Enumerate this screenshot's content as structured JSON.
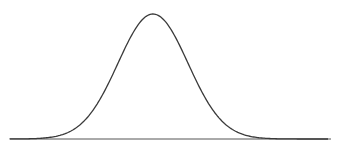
{
  "chart_data": {
    "type": "line",
    "title": "",
    "xlabel": "",
    "ylabel": "",
    "series": [
      {
        "name": "normal density",
        "distribution": "normal",
        "mean": 0,
        "std": 1,
        "x": [
          -4,
          -3.5,
          -3,
          -2.5,
          -2,
          -1.5,
          -1,
          -0.5,
          0,
          0.5,
          1,
          1.5,
          2,
          2.5,
          3,
          3.5,
          4
        ],
        "values": [
          0.0001,
          0.0009,
          0.0044,
          0.0175,
          0.054,
          0.1295,
          0.242,
          0.3521,
          0.3989,
          0.3521,
          0.242,
          0.1295,
          0.054,
          0.0175,
          0.0044,
          0.0009,
          0.0001
        ]
      }
    ],
    "xlim": [
      -4.1,
      5.0
    ],
    "ylim": [
      0,
      0.4
    ],
    "grid": false,
    "legend": "none",
    "ticks": false
  },
  "colors": {
    "curve": "#3a3a3a",
    "axis": "#555555",
    "background": "#ffffff"
  }
}
